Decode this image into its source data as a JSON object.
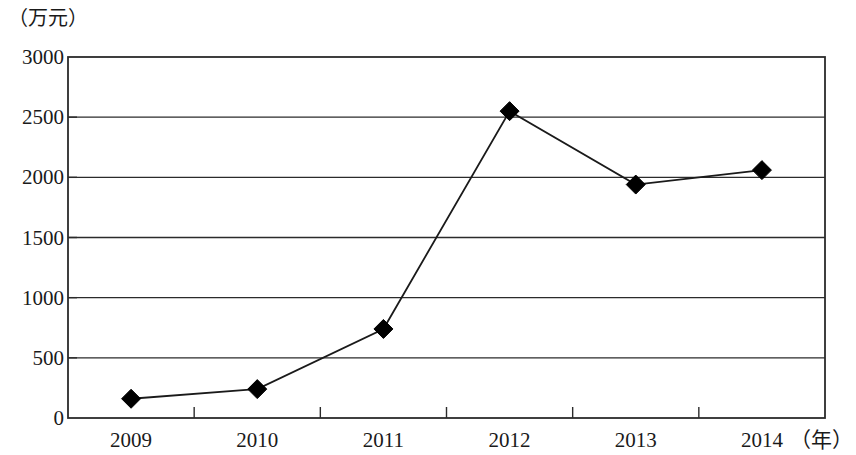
{
  "chart_data": {
    "type": "line",
    "title": "",
    "subtitle": "",
    "xlabel": "（年）",
    "ylabel": "（万元）",
    "categories": [
      "2009",
      "2010",
      "2011",
      "2012",
      "2013",
      "2014"
    ],
    "values": [
      160,
      240,
      740,
      2550,
      1940,
      2060
    ],
    "series": [
      {
        "name": "",
        "values": [
          160,
          240,
          740,
          2550,
          1940,
          2060
        ]
      }
    ],
    "ylim": [
      0,
      3000
    ],
    "yticks": [
      0,
      500,
      1000,
      1500,
      2000,
      2500,
      3000
    ],
    "ytick_labels": [
      "0",
      "500",
      "1000",
      "1500",
      "2000",
      "2500",
      "3000"
    ],
    "grid": "horizontal",
    "legend": "none",
    "marker": "diamond",
    "marker_color": "#000000",
    "line_color": "#1a1a1a",
    "plot_border": true,
    "background_color": "#ffffff"
  },
  "axis": {
    "y_unit_caption": "（万元）",
    "x_unit_caption": "（年）"
  }
}
